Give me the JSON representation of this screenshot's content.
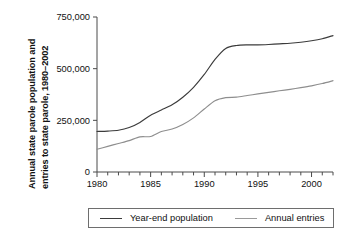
{
  "chart_data": {
    "type": "line",
    "title": "",
    "xlabel": "",
    "ylabel_line1": "Annual state parole population and",
    "ylabel_line2": "entries to state parole, 1980–2002",
    "x": [
      1980,
      1981,
      1982,
      1983,
      1984,
      1985,
      1986,
      1987,
      1988,
      1989,
      1990,
      1991,
      1992,
      1993,
      1994,
      1995,
      1996,
      1997,
      1998,
      1999,
      2000,
      2001,
      2002
    ],
    "xlim": [
      1980,
      2002
    ],
    "ylim": [
      0,
      750000
    ],
    "grid": false,
    "legend_position": "bottom",
    "xticks": [
      1980,
      1985,
      1990,
      1995,
      2000
    ],
    "xtick_labels": [
      "1980",
      "1985",
      "1990",
      "1995",
      "2000"
    ],
    "xticks_minor_every": 1,
    "yticks": [
      0,
      250000,
      500000,
      750000
    ],
    "ytick_labels": [
      "0",
      "250,000",
      "500,000",
      "750,000"
    ],
    "series": [
      {
        "name": "Year-end population",
        "color": "#3b3b3b",
        "values": [
          196000,
          198000,
          202000,
          215000,
          240000,
          275000,
          300000,
          325000,
          362000,
          410000,
          472000,
          545000,
          598000,
          612000,
          615000,
          615000,
          617000,
          620000,
          623000,
          628000,
          635000,
          645000,
          660000
        ]
      },
      {
        "name": "Annual entries",
        "color": "#8e8e8e",
        "values": [
          110000,
          124000,
          138000,
          152000,
          170000,
          172000,
          196000,
          208000,
          230000,
          262000,
          305000,
          345000,
          360000,
          362000,
          370000,
          378000,
          385000,
          393000,
          400000,
          408000,
          417000,
          428000,
          442000
        ]
      }
    ]
  },
  "legend": {
    "items": [
      {
        "label": "Year-end population"
      },
      {
        "label": "Annual entries"
      }
    ]
  }
}
